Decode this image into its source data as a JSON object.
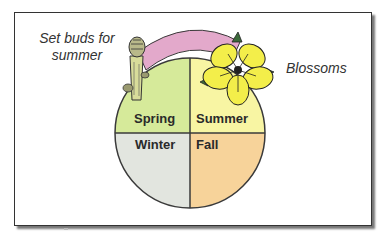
{
  "diagram": {
    "annotations": {
      "left": {
        "line1": "Set buds for",
        "line2": "summer"
      },
      "right": "Blossoms"
    },
    "seasons": [
      {
        "name": "Spring",
        "color": "#d6ea9a"
      },
      {
        "name": "Summer",
        "color": "#f8f5a3"
      },
      {
        "name": "Winter",
        "color": "#e2e5df"
      },
      {
        "name": "Fall",
        "color": "#f7d39a"
      }
    ],
    "arc_color": "#e3a9cb",
    "flower_color": "#f3ee4a",
    "outline_color": "#3a3a3a"
  }
}
